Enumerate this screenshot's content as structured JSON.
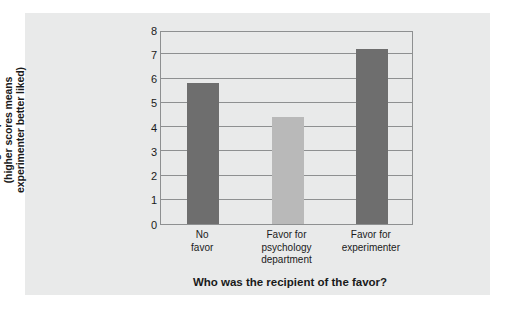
{
  "chart_data": {
    "type": "bar",
    "title": "",
    "categories": [
      "No favor",
      "Favor for psychology department",
      "Favor for experimenter"
    ],
    "category_lines": [
      [
        "No",
        "favor"
      ],
      [
        "Favor for",
        "psychology",
        "department"
      ],
      [
        "Favor for",
        "experimenter"
      ]
    ],
    "values": [
      5.8,
      4.4,
      7.2
    ],
    "xlabel": "Who was the recipient of the favor?",
    "ylabel": "Rating of experimenter (higher scores means experimenter better liked)",
    "ylabel_lines": [
      "Rating of experimenter",
      "(higher scores means",
      "experimenter better liked)"
    ],
    "ylim": [
      0,
      8
    ],
    "ytick_labels": [
      "8",
      "7",
      "6",
      "5",
      "4",
      "3",
      "2",
      "1",
      "0"
    ],
    "ytick_values": [
      8,
      7,
      6,
      5,
      4,
      3,
      2,
      1,
      0
    ],
    "grid": true,
    "legend": "none",
    "bar_colors": [
      "#6e6e6e",
      "#b9b9b9",
      "#6e6e6e"
    ],
    "axis_color": "#8e9091",
    "panel_color": "#e9eaea",
    "text_color": "#1a1a1a"
  }
}
